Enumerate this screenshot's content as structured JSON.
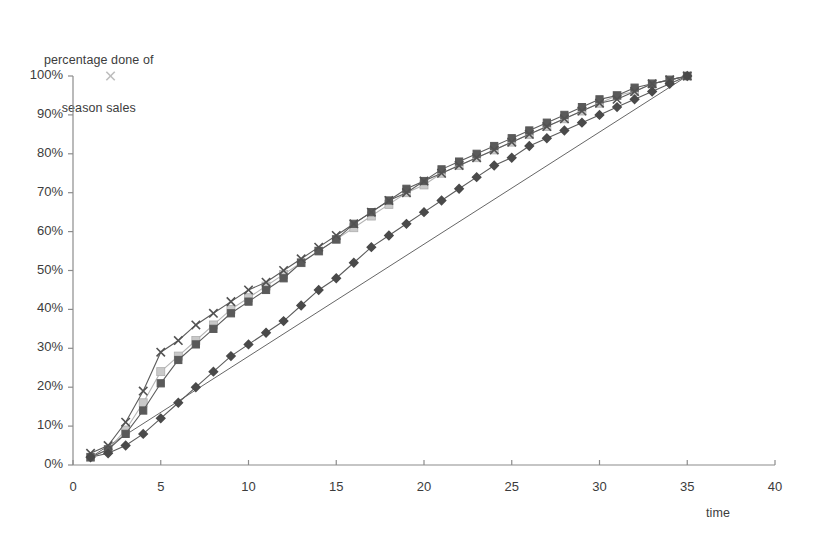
{
  "chart_data": {
    "type": "line",
    "title": "",
    "ylabel_line1": "percentage done of",
    "ylabel_line2": "season sales",
    "xlabel": "time",
    "xlim": [
      0,
      40
    ],
    "ylim": [
      0,
      100
    ],
    "xticks": [
      0,
      5,
      10,
      15,
      20,
      25,
      30,
      35,
      40
    ],
    "xtick_labels": [
      "0",
      "5",
      "10",
      "15",
      "20",
      "25",
      "30",
      "35",
      "40"
    ],
    "yticks": [
      0,
      10,
      20,
      30,
      40,
      50,
      60,
      70,
      80,
      90,
      100
    ],
    "ytick_labels": [
      "0%",
      "10%",
      "20%",
      "30%",
      "40%",
      "50%",
      "60%",
      "70%",
      "80%",
      "90%",
      "100%"
    ],
    "grid": false,
    "legend": "none",
    "x": [
      1,
      2,
      3,
      4,
      5,
      6,
      7,
      8,
      9,
      10,
      11,
      12,
      13,
      14,
      15,
      16,
      17,
      18,
      19,
      20,
      21,
      22,
      23,
      24,
      25,
      26,
      27,
      28,
      29,
      30,
      31,
      32,
      33,
      34,
      35
    ],
    "series": [
      {
        "name": "series-diamond",
        "marker": "diamond",
        "color": "#4a4a4a",
        "values": [
          2,
          3,
          5,
          8,
          12,
          16,
          20,
          24,
          28,
          31,
          34,
          37,
          41,
          45,
          48,
          52,
          56,
          59,
          62,
          65,
          68,
          71,
          74,
          77,
          79,
          82,
          84,
          86,
          88,
          90,
          92,
          94,
          96,
          98,
          100
        ]
      },
      {
        "name": "series-dark-square",
        "marker": "square",
        "color": "#5a5a5a",
        "values": [
          2,
          4,
          8,
          14,
          21,
          27,
          31,
          35,
          39,
          42,
          45,
          48,
          52,
          55,
          58,
          62,
          65,
          68,
          71,
          73,
          76,
          78,
          80,
          82,
          84,
          86,
          88,
          90,
          92,
          94,
          95,
          97,
          98,
          99,
          100
        ]
      },
      {
        "name": "series-light-square",
        "marker": "square-light",
        "color": "#c9c9c9",
        "values": [
          2,
          4,
          9,
          16,
          24,
          28,
          32,
          36,
          40,
          43,
          46,
          49,
          52,
          55,
          58,
          61,
          64,
          67,
          70,
          72,
          75,
          77,
          79,
          81,
          83,
          85,
          87,
          89,
          91,
          93,
          95,
          96,
          98,
          99,
          100
        ]
      },
      {
        "name": "series-cross",
        "marker": "cross",
        "color": "#525252",
        "values": [
          3,
          5,
          11,
          19,
          29,
          32,
          36,
          39,
          42,
          45,
          47,
          50,
          53,
          56,
          59,
          62,
          65,
          68,
          70,
          73,
          75,
          77,
          79,
          81,
          83,
          85,
          87,
          89,
          91,
          93,
          94,
          96,
          98,
          99,
          100
        ]
      }
    ],
    "reference_line": {
      "name": "linear-reference",
      "color": "#555555",
      "x": [
        1,
        35
      ],
      "y": [
        2,
        100
      ]
    },
    "stray_marker": {
      "name": "stray-cross-marker",
      "x": 1,
      "y": 100,
      "marker": "cross",
      "color": "#bdbdbd"
    },
    "axis_color": "#8c8c8c"
  }
}
